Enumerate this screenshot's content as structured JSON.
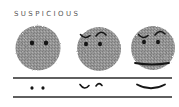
{
  "title": "SUSPICIOUS",
  "colors": {
    "face_fill": "#8f8f8f",
    "ink": "#1a1a1a",
    "line": "#333333",
    "background": "#ffffff"
  },
  "faces": [
    {
      "name": "face-eyes-only",
      "features": [
        "eyes"
      ]
    },
    {
      "name": "face-eyes-brows",
      "features": [
        "eyes",
        "brows"
      ]
    },
    {
      "name": "face-eyes-brows-mouth",
      "features": [
        "eyes",
        "brows",
        "mouth"
      ]
    }
  ],
  "feature_strip": [
    {
      "name": "strip-eyes",
      "depicts": "eyes"
    },
    {
      "name": "strip-brows",
      "depicts": "brows"
    },
    {
      "name": "strip-mouth",
      "depicts": "mouth"
    }
  ]
}
